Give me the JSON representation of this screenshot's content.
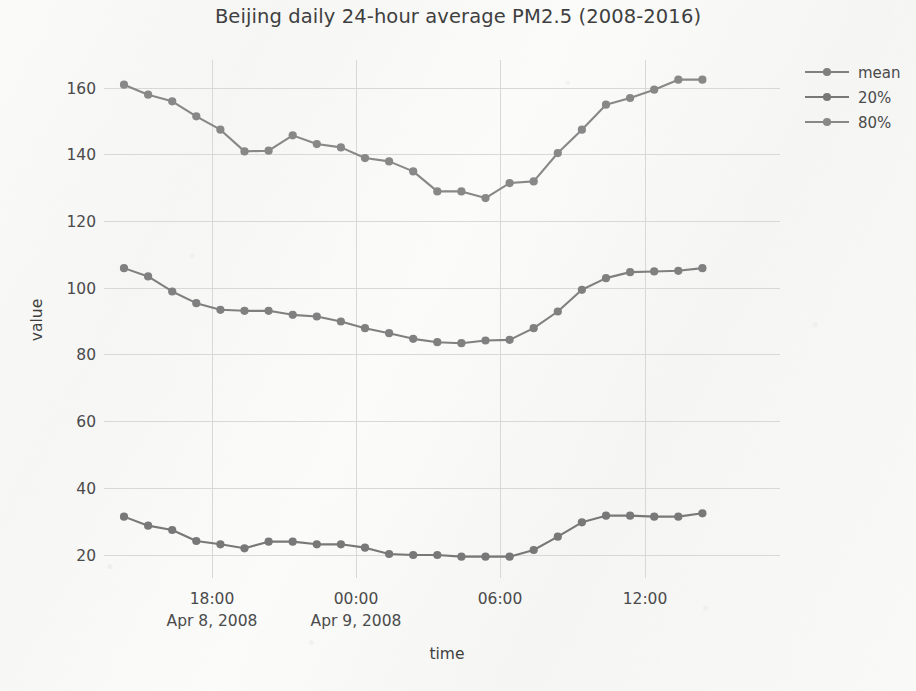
{
  "chart_data": {
    "type": "line",
    "title": "Beijing daily 24-hour average PM2.5 (2008-2016)",
    "xlabel": "time",
    "ylabel": "value",
    "grid": true,
    "legend_position": "top-right",
    "ylim": [
      12,
      170
    ],
    "yticks": [
      20,
      40,
      60,
      80,
      100,
      120,
      140,
      160
    ],
    "ytick_labels": [
      "20",
      "40",
      "60",
      "80",
      "100",
      "120",
      "140",
      "160"
    ],
    "xticks": [
      "18:00",
      "00:00",
      "06:00",
      "12:00"
    ],
    "xtick_sublabels": [
      "Apr 8, 2008",
      "Apr 9, 2008",
      "",
      ""
    ],
    "x": [
      "14:00",
      "15:00",
      "16:00",
      "17:00",
      "18:00",
      "19:00",
      "20:00",
      "21:00",
      "22:00",
      "23:00",
      "00:00",
      "01:00",
      "02:00",
      "03:00",
      "04:00",
      "05:00",
      "06:00",
      "07:00",
      "08:00",
      "09:00",
      "10:00",
      "11:00",
      "12:00",
      "13:00",
      "14:00"
    ],
    "series": [
      {
        "name": "mean",
        "color": "#808080",
        "values": [
          106.0,
          103.5,
          99.0,
          95.5,
          93.5,
          93.2,
          93.2,
          92.0,
          91.5,
          90.0,
          88.0,
          86.5,
          84.8,
          83.8,
          83.5,
          84.3,
          84.5,
          88.0,
          93.0,
          99.5,
          103.0,
          104.8,
          105.0,
          105.2,
          106.0
        ]
      },
      {
        "name": "20%",
        "color": "#787878",
        "values": [
          31.5,
          28.8,
          27.5,
          24.2,
          23.2,
          22.0,
          24.0,
          24.0,
          23.2,
          23.2,
          22.2,
          20.3,
          20.0,
          20.0,
          19.5,
          19.5,
          19.5,
          21.5,
          25.5,
          29.8,
          31.8,
          31.8,
          31.5,
          31.5,
          32.5
        ]
      },
      {
        "name": "80%",
        "color": "#888888",
        "values": [
          161.0,
          158.0,
          156.0,
          151.5,
          147.5,
          141.0,
          141.2,
          145.8,
          143.2,
          142.2,
          139.0,
          138.0,
          135.0,
          129.0,
          129.0,
          127.0,
          131.5,
          132.0,
          140.5,
          147.5,
          155.0,
          157.0,
          159.5,
          162.5,
          162.5
        ]
      }
    ]
  },
  "legend": {
    "items": [
      {
        "label": "mean"
      },
      {
        "label": "20%"
      },
      {
        "label": "80%"
      }
    ]
  },
  "colors": {
    "line_gray": "#808080",
    "grid": "#d8d8d6",
    "text": "#4a4a4a",
    "background": "#fafafa"
  }
}
